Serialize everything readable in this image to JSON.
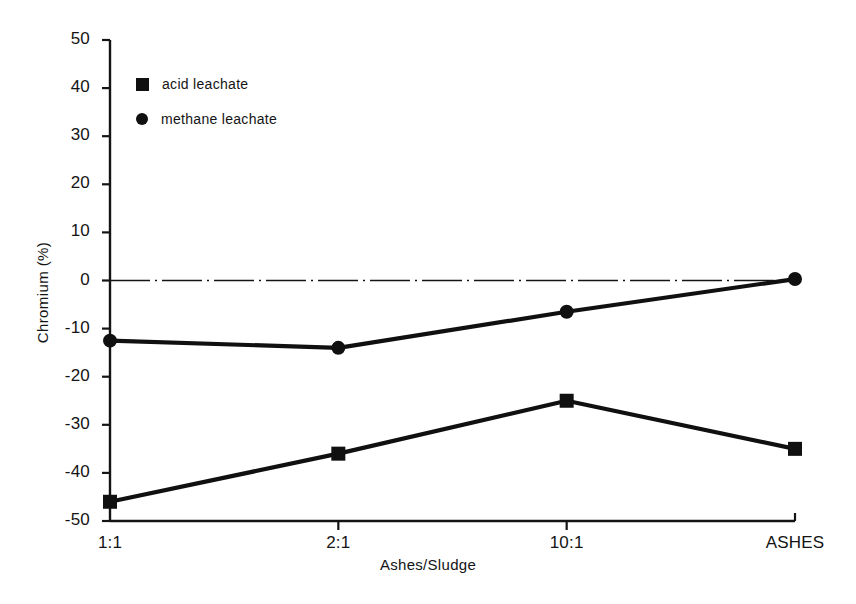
{
  "chart_data": {
    "type": "line",
    "title": "",
    "xlabel": "Ashes/Sludge",
    "ylabel": "Chromium (%)",
    "categories": [
      "1:1",
      "2:1",
      "10:1",
      "ASHES"
    ],
    "ylim": [
      -50,
      50
    ],
    "yticks": [
      50,
      40,
      30,
      20,
      10,
      0,
      -10,
      -20,
      -30,
      -40,
      -50
    ],
    "ytick_labels": [
      "50",
      "40",
      "30",
      "20",
      "10",
      "0",
      "-10",
      "-20",
      "-30",
      "-40",
      "-50"
    ],
    "grid": false,
    "legend_position": "upper-left-inside",
    "zero_line": "dash-dot",
    "series": [
      {
        "name": "acid leachate",
        "marker": "square",
        "color": "#101010",
        "values": [
          -46,
          -36,
          -25,
          -35
        ]
      },
      {
        "name": "methane leachate",
        "marker": "circle",
        "color": "#101010",
        "values": [
          -12.5,
          -14,
          -6.5,
          0.3
        ]
      }
    ]
  },
  "axes": {
    "y_title": "Chromium (%)",
    "x_title": "Ashes/Sludge",
    "y_tick_labels": [
      "50",
      "40",
      "30",
      "20",
      "10",
      "0",
      "-10",
      "-20",
      "-30",
      "-40",
      "-50"
    ],
    "x_tick_labels": [
      "1:1",
      "2:1",
      "10:1",
      "ASHES"
    ]
  },
  "legend": {
    "items": [
      {
        "label": "acid leachate",
        "marker": "square"
      },
      {
        "label": "methane leachate",
        "marker": "circle"
      }
    ]
  }
}
